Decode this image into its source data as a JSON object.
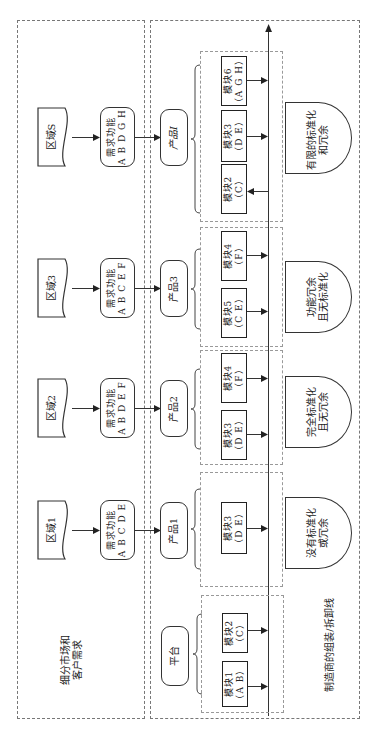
{
  "left_column": {
    "label_line1": "细分市场和",
    "label_line2": "客户需求",
    "regions": [
      {
        "name": "区域S",
        "function_title": "需求功能",
        "functions": "A B D G H"
      },
      {
        "name": "区域3",
        "function_title": "需求功能",
        "functions": "A B C E F"
      },
      {
        "name": "区域2",
        "function_title": "需求功能",
        "functions": "A B D E F"
      },
      {
        "name": "区域1",
        "function_title": "需求功能",
        "functions": "A B C D E"
      }
    ]
  },
  "right_column": {
    "label": "制造商的组装/拆卸线",
    "products": [
      {
        "name": "产品I",
        "modules": [
          {
            "name": "模块6",
            "functions": "（A G H）",
            "arrow": "to-line"
          },
          {
            "name": "模块3",
            "functions": "（D E）",
            "arrow": "to-line"
          },
          {
            "name": "模块2",
            "functions": "（C）",
            "arrow": "to-module"
          }
        ],
        "outcome_line1": "有限的标准化",
        "outcome_line2": "和冗余"
      },
      {
        "name": "产品3",
        "modules": [
          {
            "name": "模块4",
            "functions": "（F）",
            "arrow": "to-line"
          },
          {
            "name": "模块5",
            "functions": "（C E）",
            "arrow": "to-line"
          }
        ],
        "outcome_line1": "功能冗余",
        "outcome_line2": "且无标准化"
      },
      {
        "name": "产品2",
        "modules": [
          {
            "name": "模块4",
            "functions": "（F）",
            "arrow": "to-line"
          },
          {
            "name": "模块3",
            "functions": "（D E）",
            "arrow": "to-line"
          }
        ],
        "outcome_line1": "完全标准化",
        "outcome_line2": "且无冗余"
      },
      {
        "name": "产品1",
        "modules": [
          {
            "name": "模块3",
            "functions": "（D E）",
            "arrow": "to-line"
          }
        ],
        "outcome_line1": "没有标准化",
        "outcome_line2": "或冗余"
      },
      {
        "name": "平台",
        "modules": [
          {
            "name": "模块2",
            "functions": "（C）",
            "arrow": "to-line"
          },
          {
            "name": "模块1",
            "functions": "（A B）",
            "arrow": "to-line"
          }
        ]
      }
    ]
  }
}
